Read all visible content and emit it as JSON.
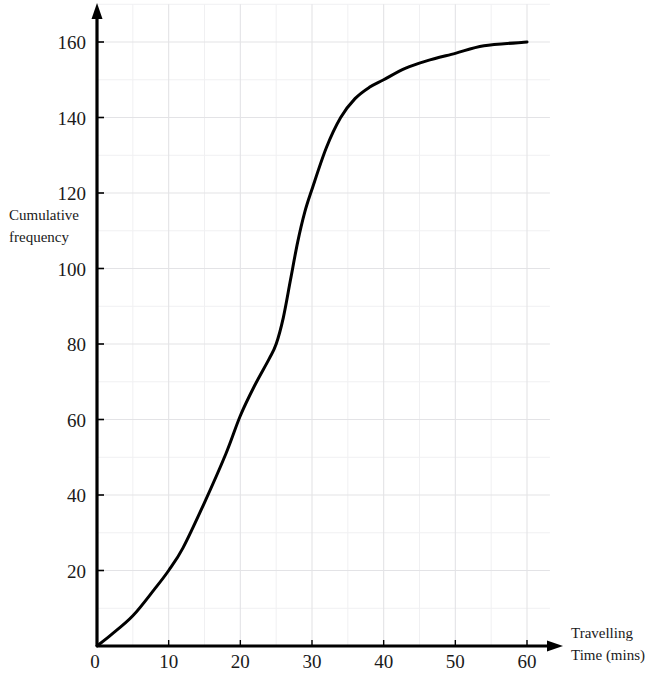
{
  "chart_data": {
    "type": "line",
    "title": "",
    "subtitle": "",
    "xlabel_lines": [
      "Travelling",
      "Time (mins)"
    ],
    "ylabel_lines": [
      "Cumulative",
      "frequency"
    ],
    "xlabel": "Travelling Time (mins)",
    "ylabel": "Cumulative frequency",
    "xlim": [
      0,
      60
    ],
    "ylim": [
      0,
      170
    ],
    "x_ticks": [
      0,
      10,
      20,
      30,
      40,
      50,
      60
    ],
    "y_ticks": [
      20,
      40,
      60,
      80,
      100,
      120,
      140,
      160
    ],
    "x_tick_labels": [
      "0",
      "10",
      "20",
      "30",
      "40",
      "50",
      "60"
    ],
    "y_tick_labels": [
      "20",
      "40",
      "60",
      "80",
      "100",
      "120",
      "140",
      "160"
    ],
    "grid": true,
    "grid_major_x_step": 10,
    "grid_minor_x_step": 5,
    "grid_major_y_step": 20,
    "grid_minor_y_step": 10,
    "legend": false,
    "legend_position": "none",
    "annotations": [],
    "series": [
      {
        "name": "Cumulative frequency curve",
        "color": "#000000",
        "x": [
          0,
          2,
          5,
          8,
          10,
          12,
          15,
          18,
          20,
          22,
          24,
          25,
          26,
          27,
          28,
          29,
          30,
          32,
          34,
          36,
          38,
          40,
          43,
          46,
          50,
          54,
          60
        ],
        "values": [
          0,
          3,
          8,
          15,
          20,
          26,
          38,
          51,
          61,
          69,
          76,
          80,
          87,
          97,
          107,
          115,
          121,
          132,
          140,
          145,
          148,
          150,
          153,
          155,
          157,
          159,
          160
        ]
      }
    ]
  },
  "axes": {
    "y_arrow": "y-axis-arrow",
    "x_arrow": "x-axis-arrow",
    "color": "#000000"
  },
  "colors": {
    "axis": "#000000",
    "curve": "#000000",
    "grid_major": "#e3e3e6",
    "grid_minor": "#f0f0f2",
    "text": "#1a1a1a",
    "background": "#ffffff"
  }
}
